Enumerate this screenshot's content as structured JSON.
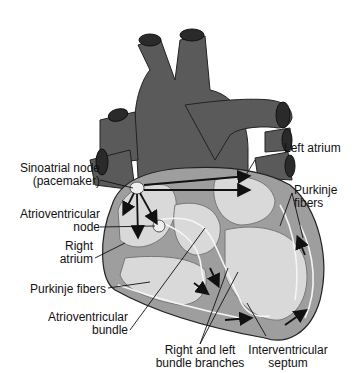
{
  "diagram": {
    "colors": {
      "vessel": "#5a5a5a",
      "vessel_dark": "#2a2a2a",
      "wall": "#9e9e9e",
      "chamber": "#d9d9d9",
      "node": "#eeeeee",
      "arrow": "#111111"
    },
    "labels": {
      "sa_node_line1": "Sinoatrial node",
      "sa_node_line2": "(pacemaker)",
      "av_node_line1": "Atrioventricular",
      "av_node_line2": "node",
      "right_atrium_line1": "Right",
      "right_atrium_line2": "atrium",
      "purkinje_left": "Purkinje fibers",
      "av_bundle_line1": "Atrioventricular",
      "av_bundle_line2": "bundle",
      "bundle_branches_line1": "Right and left",
      "bundle_branches_line2": "bundle branches",
      "septum_line1": "Interventricular",
      "septum_line2": "septum",
      "left_atrium": "Left atrium",
      "purkinje_right_line1": "Purkinje",
      "purkinje_right_line2": "fibers"
    }
  }
}
